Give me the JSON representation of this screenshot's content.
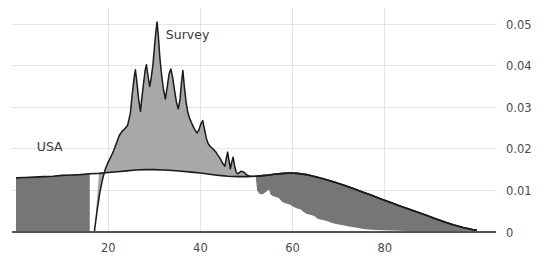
{
  "chart_data": {
    "type": "area",
    "title": "",
    "subtitle": "",
    "xlabel": "",
    "ylabel": "",
    "xlim": [
      0,
      100
    ],
    "ylim": [
      0,
      0.053
    ],
    "grid": true,
    "legend_position": "inline-annotation",
    "x_ticks": [
      20,
      40,
      60,
      80
    ],
    "x_tick_labels": [
      "20",
      "40",
      "60",
      "80"
    ],
    "y_ticks": [
      0,
      0.01,
      0.02,
      0.03,
      0.04,
      0.05
    ],
    "y_tick_labels": [
      "0",
      "0.01",
      "0.02",
      "0.03",
      "0.04",
      "0.05"
    ],
    "y_axis_side": "right",
    "annotations": [
      {
        "text": "USA",
        "x": 4.5,
        "y": 0.0195,
        "name": "usa-series-label"
      },
      {
        "text": "Survey",
        "x": 32.5,
        "y": 0.0465,
        "name": "survey-series-label"
      }
    ],
    "series": [
      {
        "name": "USA",
        "fill_color": "#767676",
        "line_color": "#1a1a1a",
        "points": [
          [
            0.0,
            0.013
          ],
          [
            2.0,
            0.0131
          ],
          [
            4.0,
            0.0132
          ],
          [
            6.0,
            0.0133
          ],
          [
            8.0,
            0.0134
          ],
          [
            10.0,
            0.0136
          ],
          [
            12.0,
            0.0137
          ],
          [
            14.0,
            0.0138
          ],
          [
            16.0,
            0.014
          ],
          [
            18.0,
            0.0141
          ],
          [
            20.0,
            0.0143
          ],
          [
            22.0,
            0.0145
          ],
          [
            24.0,
            0.0147
          ],
          [
            26.0,
            0.0149
          ],
          [
            28.0,
            0.015
          ],
          [
            30.0,
            0.015
          ],
          [
            32.0,
            0.0149
          ],
          [
            34.0,
            0.0148
          ],
          [
            36.0,
            0.0146
          ],
          [
            38.0,
            0.0144
          ],
          [
            40.0,
            0.0142
          ],
          [
            42.0,
            0.0139
          ],
          [
            44.0,
            0.0136
          ],
          [
            46.0,
            0.0134
          ],
          [
            48.0,
            0.0133
          ],
          [
            50.0,
            0.0133
          ],
          [
            52.0,
            0.0134
          ],
          [
            54.0,
            0.0136
          ],
          [
            56.0,
            0.0139
          ],
          [
            58.0,
            0.0141
          ],
          [
            59.5,
            0.0142
          ],
          [
            61.0,
            0.0141
          ],
          [
            63.0,
            0.0138
          ],
          [
            65.0,
            0.0133
          ],
          [
            67.0,
            0.0127
          ],
          [
            69.0,
            0.012
          ],
          [
            71.0,
            0.0113
          ],
          [
            73.0,
            0.0105
          ],
          [
            75.0,
            0.0097
          ],
          [
            77.0,
            0.0089
          ],
          [
            79.0,
            0.008
          ],
          [
            81.0,
            0.0072
          ],
          [
            83.0,
            0.0064
          ],
          [
            85.0,
            0.0056
          ],
          [
            87.0,
            0.0048
          ],
          [
            89.0,
            0.004
          ],
          [
            91.0,
            0.0032
          ],
          [
            93.0,
            0.0024
          ],
          [
            95.0,
            0.0017
          ],
          [
            97.0,
            0.0011
          ],
          [
            99.0,
            0.0006
          ],
          [
            100.0,
            0.0004
          ]
        ],
        "truncate_x": 16.0,
        "truncate_style": "vertical-drop-to-zero"
      },
      {
        "name": "Survey",
        "fill_color": "#a8a8a8",
        "line_color": "#1a1a1a",
        "points": [
          [
            17.0,
            0.0
          ],
          [
            17.6,
            0.0052
          ],
          [
            18.2,
            0.0096
          ],
          [
            18.8,
            0.0128
          ],
          [
            19.4,
            0.0152
          ],
          [
            20.0,
            0.0168
          ],
          [
            20.6,
            0.0181
          ],
          [
            21.2,
            0.0196
          ],
          [
            21.8,
            0.0214
          ],
          [
            22.4,
            0.0232
          ],
          [
            23.0,
            0.0242
          ],
          [
            23.6,
            0.0248
          ],
          [
            24.2,
            0.0256
          ],
          [
            24.8,
            0.0285
          ],
          [
            25.2,
            0.033
          ],
          [
            25.6,
            0.0369
          ],
          [
            25.9,
            0.039
          ],
          [
            26.2,
            0.0362
          ],
          [
            26.6,
            0.032
          ],
          [
            27.0,
            0.029
          ],
          [
            27.3,
            0.0322
          ],
          [
            27.7,
            0.036
          ],
          [
            28.0,
            0.0388
          ],
          [
            28.3,
            0.0402
          ],
          [
            28.6,
            0.0378
          ],
          [
            29.0,
            0.035
          ],
          [
            29.3,
            0.0368
          ],
          [
            29.7,
            0.0402
          ],
          [
            30.0,
            0.044
          ],
          [
            30.3,
            0.0478
          ],
          [
            30.6,
            0.0505
          ],
          [
            30.9,
            0.0468
          ],
          [
            31.2,
            0.042
          ],
          [
            31.6,
            0.0376
          ],
          [
            32.0,
            0.0342
          ],
          [
            32.4,
            0.032
          ],
          [
            32.8,
            0.0348
          ],
          [
            33.2,
            0.038
          ],
          [
            33.6,
            0.0392
          ],
          [
            34.0,
            0.037
          ],
          [
            34.4,
            0.034
          ],
          [
            34.8,
            0.0312
          ],
          [
            35.2,
            0.0296
          ],
          [
            35.6,
            0.032
          ],
          [
            35.9,
            0.036
          ],
          [
            36.2,
            0.0388
          ],
          [
            36.5,
            0.0352
          ],
          [
            36.9,
            0.0312
          ],
          [
            37.3,
            0.0286
          ],
          [
            37.7,
            0.0272
          ],
          [
            38.1,
            0.0262
          ],
          [
            38.5,
            0.0252
          ],
          [
            38.9,
            0.0244
          ],
          [
            39.3,
            0.0238
          ],
          [
            39.7,
            0.0246
          ],
          [
            40.1,
            0.026
          ],
          [
            40.5,
            0.0268
          ],
          [
            40.9,
            0.0246
          ],
          [
            41.3,
            0.0225
          ],
          [
            41.7,
            0.0212
          ],
          [
            42.1,
            0.0206
          ],
          [
            42.5,
            0.0202
          ],
          [
            42.9,
            0.0198
          ],
          [
            43.3,
            0.0193
          ],
          [
            43.7,
            0.0186
          ],
          [
            44.1,
            0.018
          ],
          [
            44.5,
            0.0172
          ],
          [
            44.9,
            0.0164
          ],
          [
            45.3,
            0.0158
          ],
          [
            45.6,
            0.0176
          ],
          [
            45.9,
            0.0192
          ],
          [
            46.2,
            0.0172
          ],
          [
            46.5,
            0.0152
          ],
          [
            46.8,
            0.0168
          ],
          [
            47.1,
            0.018
          ],
          [
            47.4,
            0.016
          ],
          [
            47.7,
            0.0146
          ],
          [
            48.0,
            0.014
          ],
          [
            48.4,
            0.0142
          ],
          [
            48.8,
            0.0146
          ],
          [
            49.2,
            0.0145
          ],
          [
            49.6,
            0.0142
          ],
          [
            50.0,
            0.0138
          ],
          [
            50.4,
            0.0135
          ],
          [
            50.8,
            0.0134
          ],
          [
            51.2,
            0.0134
          ],
          [
            51.6,
            0.0134
          ],
          [
            52.0,
            0.0134
          ]
        ],
        "truncate_x": 52.0,
        "truncate_style": "vertical-drop-to-usa"
      }
    ]
  },
  "style": {
    "background": "#ffffff",
    "grid_color": "#e4e4e4",
    "axis_color": "#555555",
    "tick_label_color": "#4a4a4a",
    "usa_fill": "#767676",
    "survey_fill": "#a8a8a8",
    "line_color": "#1a1a1a"
  }
}
